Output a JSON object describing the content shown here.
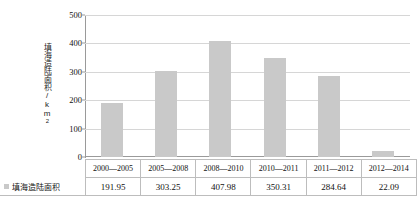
{
  "chart_data": {
    "type": "bar",
    "title": "",
    "xlabel": "",
    "ylabel": "填海造陆面积/km²",
    "ylim": [
      0,
      500
    ],
    "yticks": [
      0,
      100,
      200,
      300,
      400,
      500
    ],
    "grid": true,
    "legend_position": "bottom-left-table",
    "categories": [
      "2000—2005",
      "2005—2008",
      "2008—2010",
      "2010—2011",
      "2011—2012",
      "2012—2014"
    ],
    "series": [
      {
        "name": "填海造陆面积",
        "values": [
          191.95,
          303.25,
          407.98,
          350.31,
          284.64,
          22.09
        ],
        "color": "#c9c9c9"
      }
    ]
  },
  "axis": {
    "y_label_main": "填海造陆面积/km",
    "y_label_sup": "2",
    "tick_labels": [
      "500",
      "400",
      "300",
      "200",
      "100",
      "0"
    ]
  },
  "table": {
    "legend_label": "填海造陆面积",
    "header": [
      "2000—2005",
      "2005—2008",
      "2008—2010",
      "2010—2011",
      "2011—2012",
      "2012—2014"
    ],
    "values": [
      "191.95",
      "303.25",
      "407.98",
      "350.31",
      "284.64",
      "22.09"
    ]
  },
  "colors": {
    "bar": "#c9c9c9",
    "gridline": "#d6d6d6",
    "axis": "#9a9a9a",
    "border": "#bdbdbd",
    "background": "#ffffff"
  }
}
